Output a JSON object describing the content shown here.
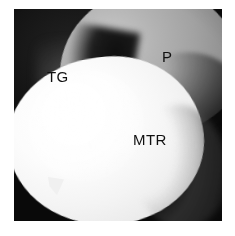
{
  "figure": {
    "kind": "arthroscopic-photograph",
    "modality": "Arthroscopy",
    "color_mode": "grayscale",
    "annotations": [
      {
        "id": "tg",
        "text": "TG",
        "meaning": "Trochlear groove"
      },
      {
        "id": "p",
        "text": "P",
        "meaning": "Patella"
      },
      {
        "id": "mtr",
        "text": "MTR",
        "meaning": "Medial trochlear ridge"
      }
    ],
    "colors": {
      "background_page": "#ffffff",
      "field_dark": "#0b0b0b",
      "patella_gray": "#a2a2a2",
      "trochlea_white": "#f4f4f4",
      "label_text": "#101010"
    }
  }
}
